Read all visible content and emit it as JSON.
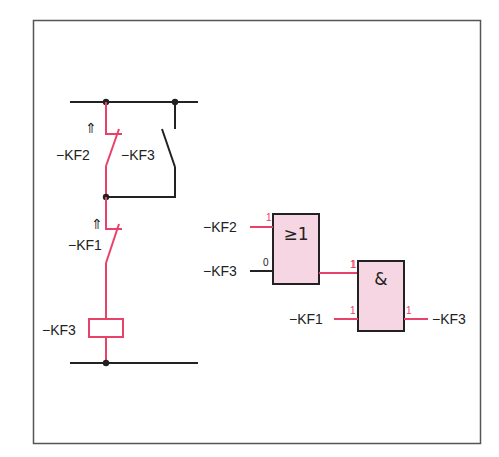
{
  "colors": {
    "active": "#e8416a",
    "wire": "#222222",
    "gate_fill": "#f7d6e3",
    "frame": "#555555"
  },
  "ladder": {
    "contact_kf2": {
      "label": "−KF2",
      "arrow": "⇑"
    },
    "contact_kf3": {
      "label": "−KF3"
    },
    "contact_kf1": {
      "label": "−KF1",
      "arrow": "⇑"
    },
    "coil": {
      "label": "−KF3"
    }
  },
  "logic": {
    "or_gate": {
      "symbol": "≥1",
      "input1": {
        "label": "−KF2",
        "state": "1"
      },
      "input2": {
        "label": "−KF3",
        "state": "0"
      },
      "output_state": "1"
    },
    "and_gate": {
      "symbol": "&",
      "input1_state": "1",
      "input2": {
        "label": "−KF1",
        "state": "1"
      },
      "output": {
        "label": "−KF3",
        "state": "1"
      }
    }
  }
}
